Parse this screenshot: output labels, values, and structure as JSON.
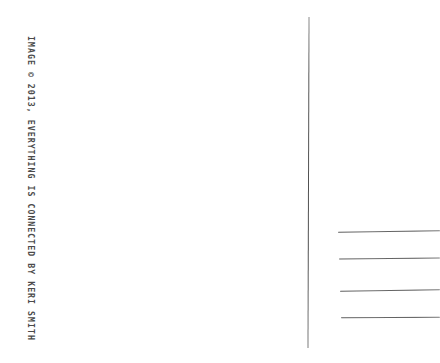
{
  "card": {
    "title": "Postcard back",
    "paper_color": "#ffffff",
    "ink_color": "#4b4b4b"
  },
  "credit": {
    "text": "IMAGE © 2013, EVERYTHING IS CONNECTED BY KERI SMITH",
    "orientation": "vertical",
    "year": "2013",
    "work_title": "EVERYTHING IS CONNECTED",
    "author": "KERI SMITH",
    "copyright_symbol": "©"
  },
  "divider": {
    "name": "vertical-divider",
    "color": "#565656"
  },
  "address_lines": [
    {
      "label": "address-line-1"
    },
    {
      "label": "address-line-2"
    },
    {
      "label": "address-line-3"
    },
    {
      "label": "address-line-4"
    }
  ]
}
